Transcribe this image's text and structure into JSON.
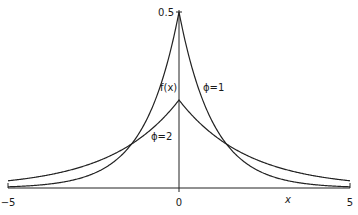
{
  "chart_data": {
    "type": "line",
    "title": "",
    "xlabel": "x",
    "ylabel": "f(x)",
    "xlim": [
      -5,
      5
    ],
    "ylim": [
      0,
      0.5
    ],
    "grid": false,
    "legend": "none (inline curve labels)",
    "x_ticks": [
      "-5",
      "0",
      "5"
    ],
    "y_ticks": [
      "0.5"
    ],
    "formula": "f(x) = (1/(2*phi)) * exp(-|x|/phi)",
    "series": [
      {
        "name": "φ=1",
        "phi": 1,
        "x": [
          -5,
          -4,
          -3,
          -2,
          -1.5,
          -1,
          -0.5,
          0,
          0.5,
          1,
          1.5,
          2,
          3,
          4,
          5
        ],
        "values": [
          0.0034,
          0.0092,
          0.0249,
          0.0677,
          0.1116,
          0.1839,
          0.3033,
          0.5,
          0.3033,
          0.1839,
          0.1116,
          0.0677,
          0.0249,
          0.0092,
          0.0034
        ]
      },
      {
        "name": "φ=2",
        "phi": 2,
        "x": [
          -5,
          -4,
          -3,
          -2,
          -1.5,
          -1,
          -0.5,
          0,
          0.5,
          1,
          1.5,
          2,
          3,
          4,
          5
        ],
        "values": [
          0.0205,
          0.0338,
          0.0558,
          0.092,
          0.1181,
          0.1516,
          0.1947,
          0.25,
          0.1947,
          0.1516,
          0.1181,
          0.092,
          0.0558,
          0.0338,
          0.0205
        ]
      }
    ],
    "annotations": [
      {
        "text": "f(x)",
        "x": -0.45,
        "y": 0.29
      },
      {
        "text": "φ=1",
        "x": 0.75,
        "y": 0.29
      },
      {
        "text": "φ=2",
        "x": -0.85,
        "y": 0.16
      }
    ]
  },
  "labels": {
    "y_top": "0.5",
    "x_min": "−5",
    "x_zero": "0",
    "x_max": "5",
    "x_axis": "x",
    "f_x": "f(x)",
    "phi1": "ϕ=1",
    "phi2": "ϕ=2"
  }
}
